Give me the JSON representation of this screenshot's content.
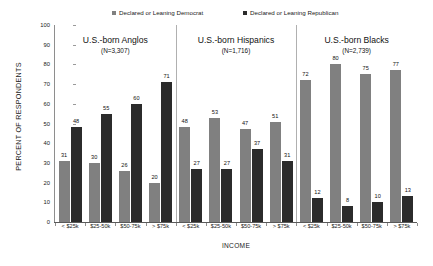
{
  "chart_data": {
    "type": "bar",
    "title": "",
    "xlabel": "INCOME",
    "ylabel": "PERCENT OF RESPONDENTS",
    "ylim": [
      0,
      100
    ],
    "ytick_step": 10,
    "yticks": [
      "100",
      "90",
      "80",
      "70",
      "60",
      "50",
      "40",
      "30",
      "20",
      "10",
      "0"
    ],
    "grid": false,
    "legend_position": "top",
    "categories": [
      "< $25k",
      "$25-50k",
      "$50-75k",
      "> $75k"
    ],
    "legend": [
      {
        "name": "Declared or Leaning Democrat",
        "color": "#808080"
      },
      {
        "name": "Declared or Leaning Republican",
        "color": "#2b2b2b"
      }
    ],
    "groups": [
      {
        "title": "U.S.-born Anglos",
        "subtitle": "(N=3,307)",
        "categories": [
          "< $25k",
          "$25-50k",
          "$50-75k",
          "> $75k"
        ],
        "series": [
          {
            "name": "Declared or Leaning Democrat",
            "values": [
              31,
              30,
              26,
              20
            ]
          },
          {
            "name": "Declared or Leaning Republican",
            "values": [
              48,
              55,
              60,
              71
            ]
          }
        ]
      },
      {
        "title": "U.S.-born Hispanics",
        "subtitle": "(N=1,716)",
        "categories": [
          "< $25k",
          "$25-50k",
          "$50-75k",
          "> $75k"
        ],
        "series": [
          {
            "name": "Declared or Leaning Democrat",
            "values": [
              48,
              53,
              47,
              51
            ]
          },
          {
            "name": "Declared or Leaning Republican",
            "values": [
              27,
              27,
              37,
              31
            ]
          }
        ]
      },
      {
        "title": "U.S.-born Blacks",
        "subtitle": "(N=2,739)",
        "categories": [
          "< $25k",
          "$25-50k",
          "$50-75k",
          "> $75k"
        ],
        "series": [
          {
            "name": "Declared or Leaning Democrat",
            "values": [
              72,
              80,
              75,
              77
            ]
          },
          {
            "name": "Declared or Leaning Republican",
            "values": [
              12,
              8,
              10,
              13
            ]
          }
        ]
      }
    ]
  }
}
